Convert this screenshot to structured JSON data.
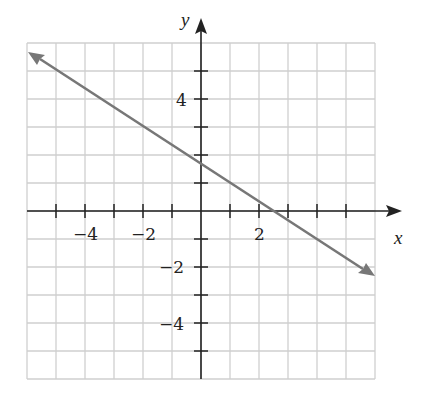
{
  "chart_data": {
    "type": "line",
    "title": "",
    "xlabel": "x",
    "ylabel": "y",
    "xlim": [
      -6,
      6
    ],
    "ylim": [
      -6,
      6
    ],
    "grid": true,
    "x_tick_labels": [
      "-4",
      "-2",
      "2"
    ],
    "y_tick_labels": [
      "4",
      "-2",
      "-4"
    ],
    "series": [
      {
        "name": "line",
        "equation": "y = -2/3 x + 5/3",
        "x": [
          -6,
          6
        ],
        "y": [
          5.67,
          -2.33
        ],
        "arrows": "both",
        "color": "#777777"
      }
    ],
    "y_intercept": 1.67,
    "x_intercept": 2.5
  },
  "labels": {
    "x_axis": "x",
    "y_axis": "y",
    "xt_m4": "−4",
    "xt_m2": "−2",
    "xt_2": "2",
    "yt_4": "4",
    "yt_m2": "−2",
    "yt_m4": "−4"
  },
  "colors": {
    "grid": "#cccccc",
    "axis": "#222222",
    "line": "#777777"
  }
}
